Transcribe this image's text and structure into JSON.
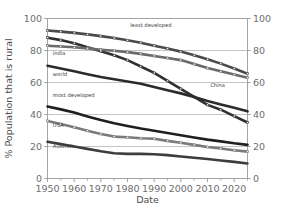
{
  "chart_data": {
    "type": "line",
    "title": "",
    "xlabel": "Date",
    "ylabel": "% Population that is rural",
    "xlim": [
      1950,
      2025
    ],
    "ylim": [
      0,
      100
    ],
    "grid": true,
    "grid_axis": "y",
    "legend_position": "inline-labels",
    "right_axis_mirrors_left": true,
    "x_tick_labels": [
      "1950",
      "1960",
      "1970",
      "1980",
      "1990",
      "2000",
      "2010",
      "2020"
    ],
    "x_tick_values": [
      1950,
      1960,
      1970,
      1980,
      1990,
      2000,
      2010,
      2020
    ],
    "x_minor_tick_values": [
      1955,
      1965,
      1975,
      1985,
      1995,
      2005,
      2015,
      2025
    ],
    "y_tick_labels": [
      "0",
      "20",
      "40",
      "60",
      "80",
      "100"
    ],
    "y_tick_values": [
      0,
      20,
      40,
      60,
      80,
      100
    ],
    "y_right_tick_labels": [
      "0",
      "20",
      "40",
      "60",
      "80",
      "100"
    ],
    "x": [
      1950,
      1955,
      1960,
      1965,
      1970,
      1975,
      1980,
      1985,
      1990,
      1995,
      2000,
      2005,
      2010,
      2015,
      2020,
      2025
    ],
    "series": [
      {
        "name": "least developed",
        "label": "least developed",
        "color": "#4a4a4a",
        "marker": "square",
        "label_x": 1981,
        "label_y": 95,
        "values": [
          92.5,
          91.8,
          91.0,
          90.1,
          89.0,
          87.8,
          86.4,
          84.8,
          83.0,
          81.2,
          79.3,
          77.0,
          74.5,
          71.8,
          68.8,
          65.5
        ]
      },
      {
        "name": "China",
        "label": "China",
        "color": "#303030",
        "marker": "square",
        "label_x": 2011,
        "label_y": 57,
        "values": [
          88.0,
          86.5,
          84.5,
          82.0,
          79.5,
          77.0,
          74.0,
          70.0,
          66.0,
          61.0,
          56.0,
          51.0,
          46.0,
          43.0,
          39.0,
          35.0
        ]
      },
      {
        "name": "india",
        "label": "india",
        "color": "#6a6a6a",
        "marker": "square",
        "label_x": 1952,
        "label_y": 77,
        "values": [
          83.0,
          82.5,
          82.0,
          81.3,
          80.5,
          79.8,
          79.0,
          77.9,
          76.6,
          75.3,
          74.0,
          71.5,
          69.0,
          67.0,
          65.0,
          63.0
        ]
      },
      {
        "name": "world",
        "label": "world",
        "color": "#2b2b2b",
        "marker": "none",
        "label_x": 1952,
        "label_y": 64,
        "values": [
          70.5,
          68.8,
          67.0,
          65.2,
          63.4,
          62.0,
          60.6,
          59.2,
          57.2,
          55.2,
          53.2,
          51.0,
          48.5,
          46.3,
          44.2,
          42.0
        ]
      },
      {
        "name": "most developed",
        "label": "most developed",
        "color": "#1f1f1f",
        "marker": "none",
        "label_x": 1952,
        "label_y": 51,
        "values": [
          45.0,
          43.2,
          41.2,
          38.8,
          36.5,
          34.5,
          32.8,
          31.2,
          29.8,
          28.4,
          27.0,
          25.6,
          24.3,
          23.2,
          22.0,
          21.0
        ]
      },
      {
        "name": "USA",
        "label": "USA",
        "color": "#7a7a7a",
        "marker": "square",
        "label_x": 1952,
        "label_y": 32,
        "values": [
          36.0,
          34.0,
          32.0,
          29.8,
          27.8,
          26.2,
          25.8,
          25.2,
          24.8,
          23.5,
          22.3,
          21.0,
          19.7,
          18.7,
          17.7,
          16.8
        ]
      },
      {
        "name": "Australia",
        "label": "Australia",
        "color": "#3d3d3d",
        "marker": "none",
        "label_x": 1952,
        "label_y": 19,
        "values": [
          23.0,
          21.5,
          20.0,
          18.5,
          17.0,
          15.8,
          15.4,
          15.4,
          15.2,
          14.6,
          13.8,
          13.0,
          12.2,
          11.3,
          10.4,
          9.4
        ]
      }
    ]
  },
  "axes": {
    "xlabel": "Date",
    "ylabel": "% Population that is rural"
  },
  "colors": {
    "grid": "#b5b5b5",
    "frame": "#9a9a9a",
    "tick_text": "#6d6d6d",
    "axis_title": "#4d4d4d",
    "background": "#ffffff"
  }
}
